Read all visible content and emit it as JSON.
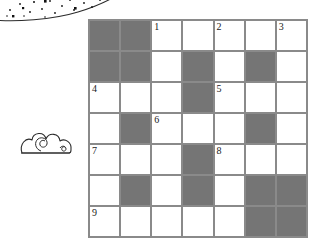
{
  "puzzle": {
    "type": "crossword-grid",
    "rows": 7,
    "columns": 7,
    "colors": {
      "shaded_cell": "#757575",
      "open_cell": "#ffffff",
      "grid_line": "#8a8a8a",
      "number_text": "#1a1a1a",
      "doodle_ink": "#2b2b2b"
    },
    "cells": [
      [
        {
          "state": "shaded",
          "number": ""
        },
        {
          "state": "shaded",
          "number": ""
        },
        {
          "state": "open",
          "number": "1"
        },
        {
          "state": "open",
          "number": ""
        },
        {
          "state": "open",
          "number": "2"
        },
        {
          "state": "open",
          "number": ""
        },
        {
          "state": "open",
          "number": "3"
        }
      ],
      [
        {
          "state": "shaded",
          "number": ""
        },
        {
          "state": "shaded",
          "number": ""
        },
        {
          "state": "open",
          "number": ""
        },
        {
          "state": "shaded",
          "number": ""
        },
        {
          "state": "open",
          "number": ""
        },
        {
          "state": "shaded",
          "number": ""
        },
        {
          "state": "open",
          "number": ""
        }
      ],
      [
        {
          "state": "open",
          "number": "4"
        },
        {
          "state": "open",
          "number": ""
        },
        {
          "state": "open",
          "number": ""
        },
        {
          "state": "shaded",
          "number": ""
        },
        {
          "state": "open",
          "number": "5"
        },
        {
          "state": "open",
          "number": ""
        },
        {
          "state": "open",
          "number": ""
        }
      ],
      [
        {
          "state": "open",
          "number": ""
        },
        {
          "state": "shaded",
          "number": ""
        },
        {
          "state": "open",
          "number": "6"
        },
        {
          "state": "open",
          "number": ""
        },
        {
          "state": "open",
          "number": ""
        },
        {
          "state": "shaded",
          "number": ""
        },
        {
          "state": "open",
          "number": ""
        }
      ],
      [
        {
          "state": "open",
          "number": "7"
        },
        {
          "state": "open",
          "number": ""
        },
        {
          "state": "open",
          "number": ""
        },
        {
          "state": "shaded",
          "number": ""
        },
        {
          "state": "open",
          "number": "8"
        },
        {
          "state": "open",
          "number": ""
        },
        {
          "state": "open",
          "number": ""
        }
      ],
      [
        {
          "state": "open",
          "number": ""
        },
        {
          "state": "shaded",
          "number": ""
        },
        {
          "state": "open",
          "number": ""
        },
        {
          "state": "shaded",
          "number": ""
        },
        {
          "state": "open",
          "number": ""
        },
        {
          "state": "shaded",
          "number": ""
        },
        {
          "state": "shaded",
          "number": ""
        }
      ],
      [
        {
          "state": "open",
          "number": "9"
        },
        {
          "state": "open",
          "number": ""
        },
        {
          "state": "open",
          "number": ""
        },
        {
          "state": "open",
          "number": ""
        },
        {
          "state": "open",
          "number": ""
        },
        {
          "state": "shaded",
          "number": ""
        },
        {
          "state": "shaded",
          "number": ""
        }
      ]
    ]
  },
  "decorations": {
    "sky": {
      "name": "dotted-arc-sky-doodle"
    },
    "cloud": {
      "name": "spiral-cloud-doodle"
    }
  }
}
